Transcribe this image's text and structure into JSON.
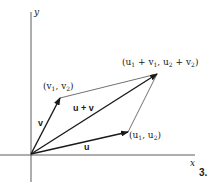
{
  "diagram": {
    "axes": {
      "x_label": "x",
      "y_label": "y"
    },
    "vectors": {
      "u": {
        "label": "u",
        "endpoint_label": [
          "(u",
          "1",
          ", u",
          "2",
          ")"
        ]
      },
      "v": {
        "label": "v",
        "endpoint_label": [
          "(v",
          "1",
          ", v",
          "2",
          ")"
        ]
      },
      "sum": {
        "label": "u + v",
        "endpoint_label": [
          "(u",
          "1",
          " + v",
          "1",
          ", u",
          "2",
          " + v",
          "2",
          ")"
        ]
      }
    },
    "figure_number": "3.",
    "colors": {
      "ink": "#1a1a1a",
      "background": "#ffffff"
    }
  }
}
